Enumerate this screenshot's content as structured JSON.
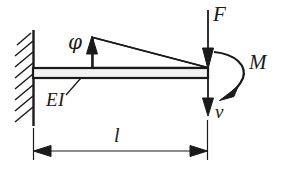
{
  "figure": {
    "width": 285,
    "height": 169,
    "background_color": "#ffffff",
    "line_color": "#1a1a1a"
  },
  "labels": {
    "force": "F",
    "moment": "M",
    "deflection": "v",
    "rotation": "φ",
    "flexural_rigidity": "EI",
    "length": "l"
  },
  "elements": {
    "wall": {
      "name": "fixed-support-wall",
      "x": 33,
      "y_top": 30,
      "y_bottom": 125,
      "hatch_count": 8
    },
    "beam": {
      "name": "beam-body",
      "x_start": 33,
      "x_end": 207,
      "y_top": 68,
      "y_bottom": 78
    },
    "deflection_wedge": {
      "name": "deflected-shape-wedge",
      "x_start": 93,
      "y_start": 38,
      "x_end": 207,
      "y_end": 68
    },
    "rotation_arrow": {
      "name": "rotation-angle-arrow",
      "x": 92,
      "y_tail": 68,
      "y_head": 38,
      "direction": "up"
    },
    "force_arrow": {
      "name": "force-arrow",
      "x": 208,
      "y_tail": 10,
      "y_head": 68,
      "direction": "down"
    },
    "deflection_arrow": {
      "name": "deflection-arrow",
      "x": 208,
      "y_tail": 78,
      "y_head": 116,
      "direction": "down"
    },
    "moment_arc": {
      "name": "moment-arc",
      "start_x": 214,
      "start_y": 52,
      "end_x": 229,
      "end_y": 93,
      "bulge_x": 243,
      "direction": "clockwise"
    },
    "ei_leader": {
      "name": "flexural-rigidity-leader-line",
      "x_start": 66,
      "y_start": 94,
      "x_end": 80,
      "y_end": 78
    },
    "dimension_line": {
      "name": "length-dimension-line",
      "y": 151,
      "x_start": 33,
      "x_end": 207,
      "extension_top": 128,
      "arrowheads": "both"
    }
  }
}
